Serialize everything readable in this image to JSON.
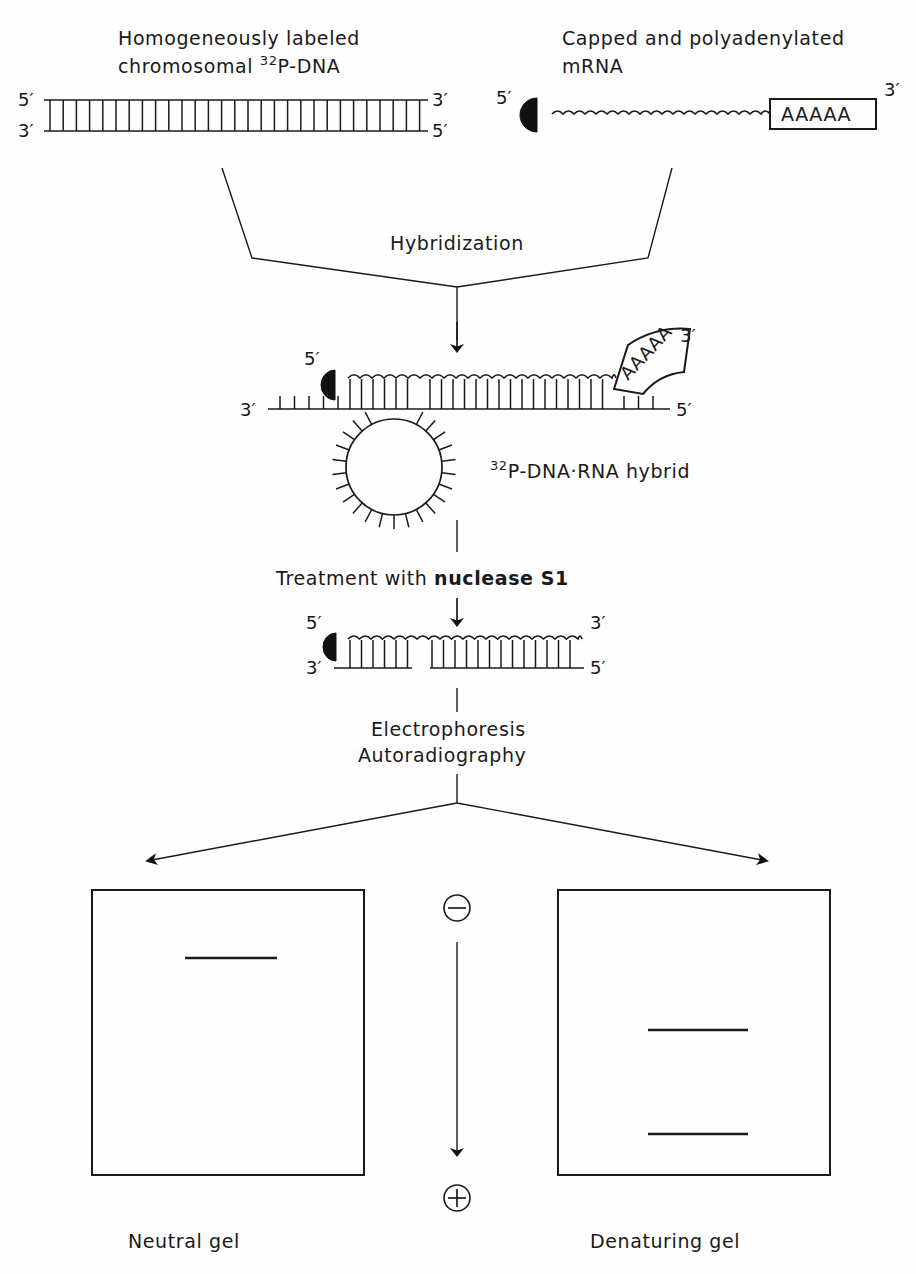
{
  "figure": {
    "ink_color": "#1a1a1a",
    "background_color": "#fefefe"
  },
  "panels": {
    "dna_label_line1": "Homogeneously labeled",
    "dna_label_line2_pre": "chromosomal ",
    "dna_label_isotope": "32",
    "dna_label_line2_post": "P-DNA",
    "mrna_label_line1": "Capped and polyadenylated",
    "mrna_label_line2": "mRNA",
    "polya_text": "AAAAA"
  },
  "steps": {
    "hybridization": "Hybridization",
    "hybrid_label_isotope": "32",
    "hybrid_label_text": "P-DNA·RNA hybrid",
    "treatment_prefix": "Treatment with ",
    "treatment_enzyme": "nuclease S1",
    "electrophoresis": "Electrophoresis",
    "autoradiography": "Autoradiography"
  },
  "primes": {
    "five": "5′",
    "three": "3′"
  },
  "gels": {
    "neutral_label": "Neutral gel",
    "denaturing_label": "Denaturing gel",
    "neutral_band_count": 1,
    "denaturing_band_count": 2
  },
  "polarity": {
    "top_symbol": "⊖",
    "bottom_symbol": "⊕",
    "top_name": "negative-electrode",
    "bottom_name": "positive-electrode"
  },
  "icons": {
    "cap_icon": "mrna-cap-halfdisc",
    "arrow_down_icon": "arrow-down",
    "arrow_branch_left_icon": "arrow-branch-left",
    "arrow_branch_right_icon": "arrow-branch-right"
  }
}
